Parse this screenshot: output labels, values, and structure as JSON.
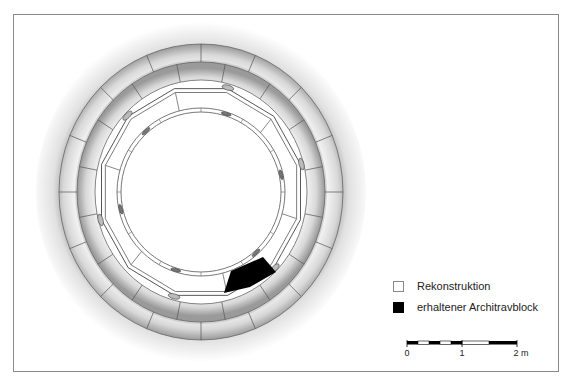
{
  "figure": {
    "colors": {
      "frame": "#8a8a8a",
      "reconstruction": "#ffffff",
      "preserved": "#000000",
      "line": "#555555"
    }
  },
  "legend": {
    "items": [
      {
        "label": "Rekonstruktion",
        "swatch": "white"
      },
      {
        "label": "erhaltener Architravblock",
        "swatch": "black"
      }
    ]
  },
  "scale_bar": {
    "ticks": [
      {
        "label": "0"
      },
      {
        "label": "1"
      },
      {
        "label": "2 m"
      }
    ]
  }
}
